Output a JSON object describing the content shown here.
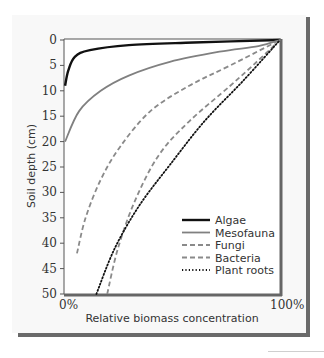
{
  "chart_data": {
    "type": "line",
    "title": "",
    "xlabel": "Relative biomass concentration",
    "ylabel": "Soil depth (cm)",
    "x_tick_labels": [
      "0%",
      "100%"
    ],
    "y_ticks": [
      0,
      5,
      10,
      15,
      20,
      25,
      30,
      35,
      40,
      45,
      50
    ],
    "xlim": [
      0,
      100
    ],
    "ylim": [
      50,
      0
    ],
    "y_inverted": true,
    "grid": false,
    "legend_position": "lower right",
    "series": [
      {
        "name": "Algae",
        "style": "solid",
        "color": "#111111",
        "width": 2.4,
        "points": [
          [
            0.5,
            9
          ],
          [
            2,
            6
          ],
          [
            5,
            3.3
          ],
          [
            12,
            2
          ],
          [
            30,
            1
          ],
          [
            60,
            0.5
          ],
          [
            100,
            0
          ]
        ]
      },
      {
        "name": "Mesofauna",
        "style": "solid",
        "color": "#808080",
        "width": 1.8,
        "points": [
          [
            0.5,
            20
          ],
          [
            7,
            14
          ],
          [
            17,
            10
          ],
          [
            30,
            7
          ],
          [
            49,
            4.3
          ],
          [
            72,
            2.3
          ],
          [
            90,
            1.2
          ],
          [
            100,
            0
          ]
        ]
      },
      {
        "name": "Fungi",
        "style": "dashed",
        "color": "#8a8a8a",
        "width": 1.8,
        "points": [
          [
            6,
            42
          ],
          [
            10,
            35
          ],
          [
            17,
            27.5
          ],
          [
            26,
            21
          ],
          [
            40,
            14
          ],
          [
            58,
            9
          ],
          [
            77,
            5
          ],
          [
            100,
            0
          ]
        ]
      },
      {
        "name": "Bacteria",
        "style": "dashed",
        "color": "#8a8a8a",
        "width": 1.8,
        "points": [
          [
            20,
            50
          ],
          [
            25,
            41
          ],
          [
            33,
            31.5
          ],
          [
            44,
            22.6
          ],
          [
            58,
            16
          ],
          [
            77,
            9
          ],
          [
            90,
            4
          ],
          [
            100,
            0
          ]
        ]
      },
      {
        "name": "Plant roots",
        "style": "dotted",
        "color": "#111111",
        "width": 1.8,
        "points": [
          [
            15,
            50
          ],
          [
            23.5,
            41
          ],
          [
            35,
            32.5
          ],
          [
            49,
            24.6
          ],
          [
            65,
            16
          ],
          [
            83,
            8
          ],
          [
            100,
            0
          ]
        ]
      }
    ]
  },
  "labels": {
    "ylabel": "Soil depth (cm)",
    "xlabel": "Relative biomass concentration",
    "x_min": "0%",
    "x_max": "100%",
    "y_ticks": [
      "0",
      "5",
      "10",
      "15",
      "20",
      "25",
      "30",
      "35",
      "40",
      "45",
      "50"
    ]
  },
  "legend": [
    {
      "label": "Algae"
    },
    {
      "label": "Mesofauna"
    },
    {
      "label": "Fungi"
    },
    {
      "label": "Bacteria"
    },
    {
      "label": "Plant roots"
    }
  ]
}
